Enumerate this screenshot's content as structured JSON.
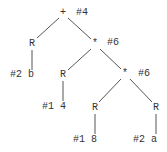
{
  "tree": {
    "nodes": [
      {
        "id": "n0",
        "label": "+",
        "annotation": "#4",
        "x": 63,
        "y": 13
      },
      {
        "id": "n1",
        "label": "R",
        "annotation": "",
        "x": 32,
        "y": 44
      },
      {
        "id": "n2",
        "label": "*",
        "annotation": "#6",
        "x": 95,
        "y": 44
      },
      {
        "id": "n3",
        "label": "#2 b",
        "annotation": "",
        "x": 22,
        "y": 75
      },
      {
        "id": "n4",
        "label": "R",
        "annotation": "",
        "x": 63,
        "y": 75
      },
      {
        "id": "n5",
        "label": "*",
        "annotation": "#6",
        "x": 125,
        "y": 74
      },
      {
        "id": "n6",
        "label": "#1 4",
        "annotation": "",
        "x": 55,
        "y": 107
      },
      {
        "id": "n7",
        "label": "R",
        "annotation": "",
        "x": 95,
        "y": 108
      },
      {
        "id": "n8",
        "label": "R",
        "annotation": "",
        "x": 156,
        "y": 108
      },
      {
        "id": "n9",
        "label": "#1 8",
        "annotation": "",
        "x": 85,
        "y": 140
      },
      {
        "id": "n10",
        "label": "#2 a",
        "annotation": "",
        "x": 146,
        "y": 140
      }
    ],
    "labels": {
      "root_op": "+",
      "root_ann": "#4",
      "r_left": "R",
      "leaf_left": "#2 b",
      "mul1": "*",
      "mul1_ann": "#6",
      "r_mid": "R",
      "leaf_mid": "#1 4",
      "mul2": "*",
      "mul2_ann": "#6",
      "r_a": "R",
      "leaf_a": "#1 8",
      "r_b": "R",
      "leaf_b": "#2 a"
    }
  }
}
